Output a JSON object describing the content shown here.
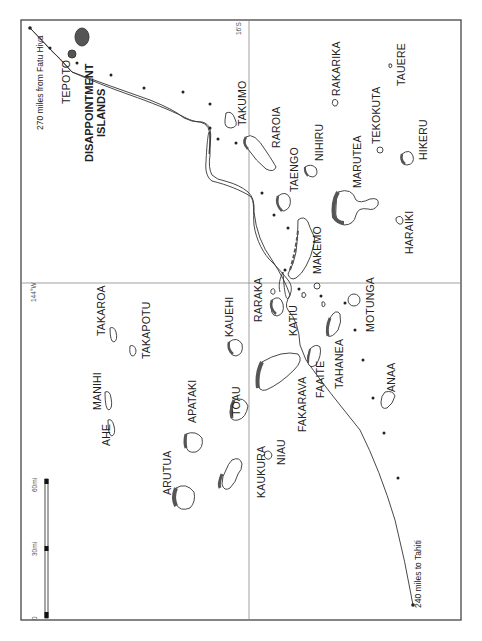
{
  "map": {
    "frame": {
      "x": 21,
      "y": 20,
      "width": 440,
      "height": 600
    },
    "gridlines": {
      "meridian_label": "144°W",
      "parallel_label": "16'S"
    },
    "scale_bar": {
      "ticks": [
        "0",
        "30mi",
        "60mi"
      ]
    },
    "route": {
      "start_label": "270 miles from Fatu Hiva",
      "end_label": "240 miles to Tahiti"
    },
    "group_label": {
      "line1": "DISAPPOINTMENT",
      "line2": "ISLANDS"
    },
    "islands": [
      {
        "name": "TEPOTO"
      },
      {
        "name": "TAKUMO"
      },
      {
        "name": "RAROIA"
      },
      {
        "name": "RAKARIKA"
      },
      {
        "name": "TAUERE"
      },
      {
        "name": "TEKOKUTA"
      },
      {
        "name": "NIHIRU"
      },
      {
        "name": "HIKERU"
      },
      {
        "name": "TAENGO"
      },
      {
        "name": "MARUTEA"
      },
      {
        "name": "HARAIKI"
      },
      {
        "name": "MAKEMO"
      },
      {
        "name": "MOTUNGA"
      },
      {
        "name": "RARAKA"
      },
      {
        "name": "KATIU"
      },
      {
        "name": "TAHANEA"
      },
      {
        "name": "FAAITE"
      },
      {
        "name": "ANAA"
      },
      {
        "name": "KAUEHI"
      },
      {
        "name": "FAKARAVA"
      },
      {
        "name": "TOAU"
      },
      {
        "name": "NIAU"
      },
      {
        "name": "KAUKURA"
      },
      {
        "name": "TAKAROA"
      },
      {
        "name": "TAKAPOTU"
      },
      {
        "name": "MANIHI"
      },
      {
        "name": "AHE"
      },
      {
        "name": "APATAKI"
      },
      {
        "name": "ARUTUA"
      }
    ],
    "colors": {
      "line": "#333333",
      "land": "#555555",
      "grid": "#888888",
      "frame": "#444444"
    }
  }
}
